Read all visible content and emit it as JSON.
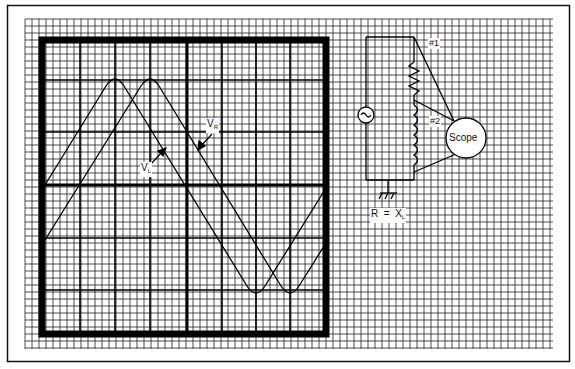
{
  "diagram": {
    "colors": {
      "ink": "#111111",
      "grid": "#222222",
      "paper": "#ffffff"
    },
    "scope_screen": {
      "waveforms": [
        {
          "name": "V_L",
          "peak_x": 115,
          "trough_x": 256
        },
        {
          "name": "V_R",
          "peak_x": 150,
          "trough_x": 290
        }
      ],
      "labels": {
        "vl_main": "V",
        "vl_sub": "L",
        "vr_main": "V",
        "vr_sub": "R"
      }
    },
    "circuit": {
      "source_symbol": "ac-source",
      "components": [
        "resistor",
        "inductor",
        "ground"
      ],
      "probe1_label": "#1",
      "probe2_label": "#2",
      "scope_label": "Scope",
      "condition_main": "R  =  X",
      "condition_sub": "L"
    }
  }
}
